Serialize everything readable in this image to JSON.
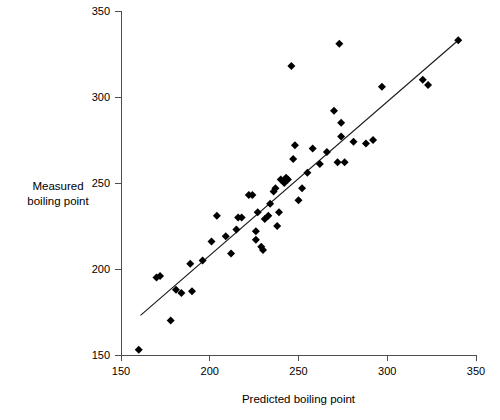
{
  "chart_data": {
    "type": "scatter",
    "title": "",
    "xlabel": "Predicted boiling point",
    "ylabel": "Measured boiling point",
    "ylabel_lines": [
      "Measured",
      "boiling point"
    ],
    "xlim": [
      150,
      350
    ],
    "ylim": [
      150,
      350
    ],
    "xticks": [
      150,
      200,
      250,
      300,
      350
    ],
    "yticks": [
      150,
      200,
      250,
      300,
      350
    ],
    "xtick_labels": [
      "150",
      "200",
      "250",
      "300",
      "350"
    ],
    "ytick_labels": [
      "150",
      "200",
      "250",
      "300",
      "350"
    ],
    "grid": false,
    "legend": null,
    "marker": "diamond",
    "marker_color": "#000000",
    "points": [
      [
        160,
        153
      ],
      [
        170,
        195
      ],
      [
        172,
        196
      ],
      [
        178,
        170
      ],
      [
        181,
        188
      ],
      [
        184,
        186
      ],
      [
        189,
        203
      ],
      [
        190,
        187
      ],
      [
        196,
        205
      ],
      [
        201,
        216
      ],
      [
        204,
        231
      ],
      [
        209,
        219
      ],
      [
        212,
        209
      ],
      [
        215,
        223
      ],
      [
        216,
        230
      ],
      [
        218,
        230
      ],
      [
        222,
        243
      ],
      [
        224,
        243
      ],
      [
        226,
        222
      ],
      [
        226,
        217
      ],
      [
        227,
        233
      ],
      [
        229,
        213
      ],
      [
        230,
        211
      ],
      [
        231,
        229
      ],
      [
        233,
        231
      ],
      [
        234,
        238
      ],
      [
        236,
        245
      ],
      [
        237,
        247
      ],
      [
        238,
        225
      ],
      [
        239,
        233
      ],
      [
        240,
        252
      ],
      [
        242,
        250
      ],
      [
        243,
        253
      ],
      [
        244,
        252
      ],
      [
        246,
        318
      ],
      [
        247,
        264
      ],
      [
        248,
        272
      ],
      [
        250,
        240
      ],
      [
        252,
        247
      ],
      [
        255,
        256
      ],
      [
        258,
        270
      ],
      [
        262,
        261
      ],
      [
        266,
        268
      ],
      [
        270,
        292
      ],
      [
        272,
        262
      ],
      [
        273,
        331
      ],
      [
        274,
        277
      ],
      [
        274,
        285
      ],
      [
        276,
        262
      ],
      [
        281,
        274
      ],
      [
        288,
        273
      ],
      [
        292,
        275
      ],
      [
        297,
        306
      ],
      [
        320,
        310
      ],
      [
        323,
        307
      ],
      [
        340,
        333
      ]
    ],
    "trend_line": {
      "x_start": 161,
      "y_start": 173,
      "x_end": 340,
      "y_end": 333,
      "color": "#1a1a1a"
    }
  },
  "axes": {
    "y_axis_name": "y-axis",
    "x_axis_name": "x-axis"
  }
}
